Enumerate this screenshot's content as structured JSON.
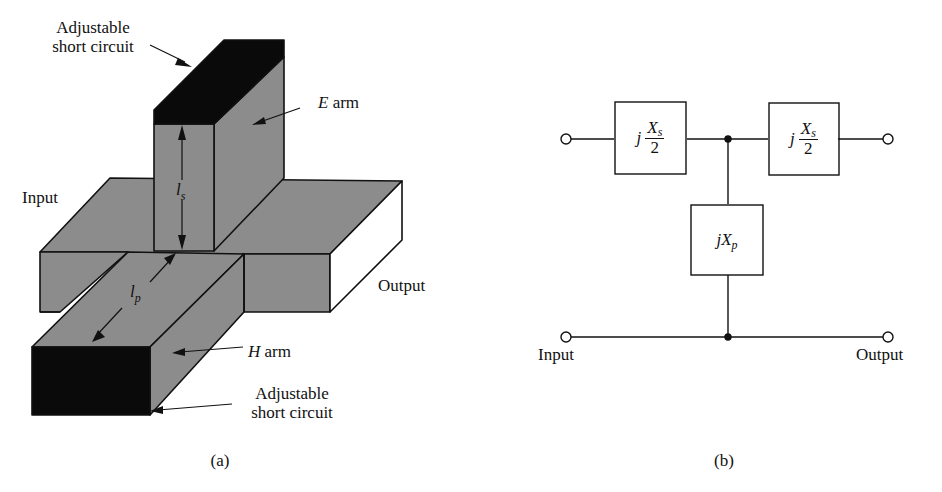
{
  "figure_a": {
    "caption": "(a)",
    "labels": {
      "top_short_circuit": [
        "Adjustable",
        "short circuit"
      ],
      "e_arm_letter": "E",
      "e_arm_word": "arm",
      "input": "Input",
      "output": "Output",
      "ls_main": "l",
      "ls_sub": "s",
      "lp_main": "l",
      "lp_sub": "p",
      "h_arm_letter": "H",
      "h_arm_word": "arm",
      "bottom_short_circuit": [
        "Adjustable",
        "short circuit"
      ]
    },
    "colors": {
      "waveguide": "#8c8c8c",
      "short_circuit": "#0a0a0a",
      "open_face": "#ffffff"
    }
  },
  "figure_b": {
    "caption": "(b)",
    "series_left": {
      "prefix": "j",
      "num_main": "X",
      "num_sub": "s",
      "den": "2"
    },
    "series_right": {
      "prefix": "j",
      "num_main": "X",
      "num_sub": "s",
      "den": "2"
    },
    "shunt": {
      "prefix": "j",
      "main": "X",
      "sub": "p"
    },
    "input_label": "Input",
    "output_label": "Output"
  }
}
